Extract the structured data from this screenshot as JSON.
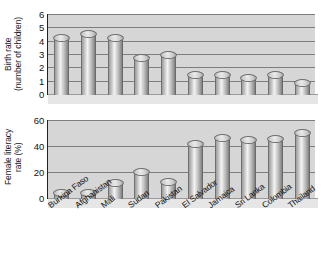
{
  "chart_data": [
    {
      "type": "bar",
      "title": "",
      "xlabel": "",
      "ylabel": "Birth rate\n(number of children)",
      "ylim": [
        0,
        6
      ],
      "yticks": [
        0,
        1,
        2,
        3,
        4,
        5,
        6
      ],
      "ytick_labels": [
        "0",
        "1",
        "2",
        "3",
        "4",
        "5",
        "6"
      ],
      "grid": true,
      "legend": "none",
      "categories": [
        "Burkina Faso",
        "Afghanistan",
        "Mali",
        "Sudan",
        "Pakistan",
        "El Salvador",
        "Jamaica",
        "Sri Lanka",
        "Colombia",
        "Thailand"
      ],
      "values": [
        4.3,
        4.6,
        4.3,
        2.8,
        3.0,
        1.5,
        1.5,
        1.3,
        1.5,
        0.9
      ]
    },
    {
      "type": "bar",
      "title": "",
      "xlabel": "",
      "ylabel": "Female literacy\nrate (%)",
      "ylim": [
        0,
        60
      ],
      "yticks": [
        0,
        20,
        40,
        60
      ],
      "ytick_labels": [
        "0",
        "20",
        "40",
        "60"
      ],
      "grid": true,
      "legend": "none",
      "categories": [
        "Burkina Faso",
        "Afghanistan",
        "Mali",
        "Sudan",
        "Pakistan",
        "El Salvador",
        "Jamaica",
        "Sri Lanka",
        "Colombia",
        "Thailand"
      ],
      "values": [
        3,
        4,
        12,
        21,
        13,
        42,
        47,
        45,
        46,
        51
      ]
    }
  ],
  "top_chart": {
    "axis_title": "Birth rate\n(number of children)",
    "ytick_labels": [
      "6",
      "5",
      "4",
      "3",
      "2",
      "1",
      "0"
    ]
  },
  "bottom_chart": {
    "axis_title": "Female literacy\nrate (%)",
    "ytick_labels": [
      "60",
      "40",
      "20",
      "0"
    ]
  },
  "categories": [
    "Burkina Faso",
    "Afghanistan",
    "Mali",
    "Sudan",
    "Pakistan",
    "El Salvador",
    "Jamaica",
    "Sri Lanka",
    "Colombia",
    "Thailand"
  ],
  "colors": {
    "plot_background": "#d6d6d6",
    "gridline": "#7e7e7e",
    "axis": "#222222",
    "bar_light": "#f2f2f2",
    "bar_dark": "#7d7d7d",
    "text": "#111111"
  }
}
